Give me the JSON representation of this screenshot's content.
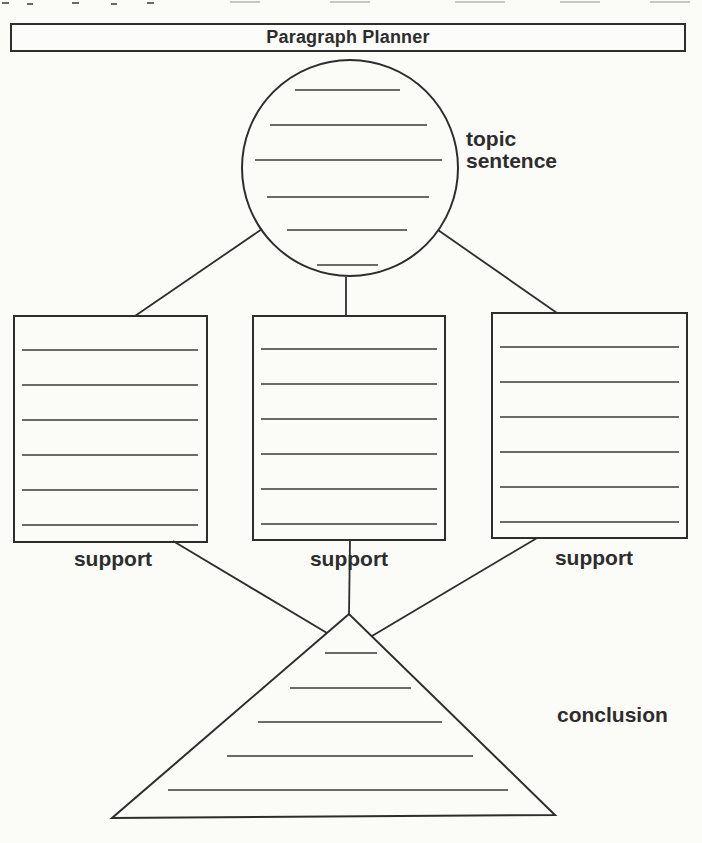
{
  "page": {
    "background_color": "#fbfbf8",
    "ink_color": "#2d2d2d"
  },
  "title_bar": {
    "label": "Paragraph Planner"
  },
  "diagram": {
    "nodes": [
      {
        "id": "topic-sentence",
        "shape": "circle",
        "label": "topic\nsentence",
        "writing_lines": 6
      },
      {
        "id": "support-left",
        "shape": "rectangle",
        "label": "support",
        "writing_lines": 6
      },
      {
        "id": "support-middle",
        "shape": "rectangle",
        "label": "support",
        "writing_lines": 6
      },
      {
        "id": "support-right",
        "shape": "rectangle",
        "label": "support",
        "writing_lines": 6
      },
      {
        "id": "conclusion",
        "shape": "triangle",
        "label": "conclusion",
        "writing_lines": 5
      }
    ],
    "connections": [
      {
        "from": "topic-sentence",
        "to": "support-left"
      },
      {
        "from": "topic-sentence",
        "to": "support-middle"
      },
      {
        "from": "topic-sentence",
        "to": "support-right"
      },
      {
        "from": "support-left",
        "to": "conclusion"
      },
      {
        "from": "support-middle",
        "to": "conclusion"
      },
      {
        "from": "support-right",
        "to": "conclusion"
      }
    ]
  }
}
